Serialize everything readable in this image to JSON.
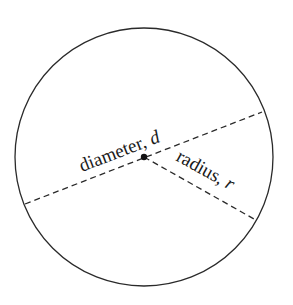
{
  "diagram": {
    "diameter_label": "diameter, ",
    "diameter_symbol": "d",
    "radius_label": "radius, ",
    "radius_symbol": "r",
    "colors": {
      "line": "#2a2a2a",
      "background": "#ffffff"
    }
  }
}
